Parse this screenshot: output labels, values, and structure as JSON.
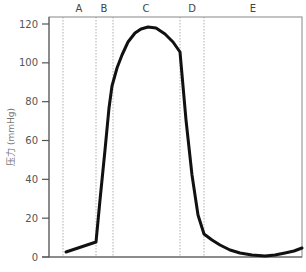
{
  "chart_data": {
    "type": "line",
    "title": "",
    "xlabel": "",
    "ylabel": "压力 (mmHg)",
    "ylim": [
      0,
      120
    ],
    "yticks": [
      0,
      20,
      40,
      60,
      80,
      100,
      120
    ],
    "grid": false,
    "legend": null,
    "phases": [
      {
        "label": "A",
        "x_start": 63,
        "x_end": 96
      },
      {
        "label": "B",
        "x_start": 96,
        "x_end": 113
      },
      {
        "label": "C",
        "x_start": 113,
        "x_end": 180
      },
      {
        "label": "D",
        "x_start": 180,
        "x_end": 204
      },
      {
        "label": "E",
        "x_start": 204,
        "x_end": 302
      }
    ],
    "phase_boundaries_px": [
      63,
      96,
      113,
      180,
      204
    ],
    "series": [
      {
        "name": "pressure",
        "color": "#111111",
        "points_px": [
          [
            66,
            252
          ],
          [
            96,
            242
          ],
          [
            100,
            200
          ],
          [
            105,
            150
          ],
          [
            109,
            108
          ],
          [
            112,
            86
          ],
          [
            117,
            68
          ],
          [
            122,
            55
          ],
          [
            128,
            42
          ],
          [
            135,
            33
          ],
          [
            141,
            29
          ],
          [
            148,
            27
          ],
          [
            156,
            28
          ],
          [
            165,
            34
          ],
          [
            173,
            42
          ],
          [
            180,
            52
          ],
          [
            186,
            120
          ],
          [
            192,
            175
          ],
          [
            198,
            215
          ],
          [
            204,
            234
          ],
          [
            212,
            240
          ],
          [
            220,
            245
          ],
          [
            230,
            250
          ],
          [
            240,
            253
          ],
          [
            252,
            255
          ],
          [
            265,
            256
          ],
          [
            275,
            255
          ],
          [
            285,
            253
          ],
          [
            294,
            251
          ],
          [
            302,
            248
          ]
        ],
        "values": [
          {
            "x": 66,
            "y": 2.5
          },
          {
            "x": 96,
            "y": 8
          },
          {
            "x": 105,
            "y": 55
          },
          {
            "x": 112,
            "y": 92
          },
          {
            "x": 122,
            "y": 110
          },
          {
            "x": 135,
            "y": 115
          },
          {
            "x": 148,
            "y": 118
          },
          {
            "x": 165,
            "y": 115
          },
          {
            "x": 180,
            "y": 105
          },
          {
            "x": 204,
            "y": 12
          },
          {
            "x": 220,
            "y": 6
          },
          {
            "x": 240,
            "y": 2
          },
          {
            "x": 265,
            "y": 1
          },
          {
            "x": 285,
            "y": 2
          },
          {
            "x": 302,
            "y": 4.5
          }
        ]
      }
    ]
  },
  "labels": {
    "ylabel": "压力 (mmHg)",
    "phases": [
      "A",
      "B",
      "C",
      "D",
      "E"
    ],
    "yticks": [
      "0",
      "20",
      "40",
      "60",
      "80",
      "100",
      "120"
    ]
  }
}
